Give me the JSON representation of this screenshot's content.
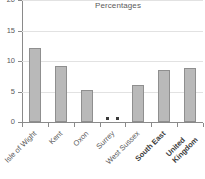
{
  "chart_data": {
    "type": "bar",
    "title": "Percentages",
    "xlabel": "",
    "ylabel": "",
    "categories": [
      "Isle of Wight",
      "Kent",
      "Oxon",
      "Surrey",
      "West Sussex",
      "South East",
      "United Kingdom"
    ],
    "category_lines": [
      [
        "Isle of Wight"
      ],
      [
        "Kent"
      ],
      [
        "Oxon"
      ],
      [
        "Surrey"
      ],
      [
        "West Sussex"
      ],
      [
        "South East"
      ],
      [
        "United",
        "Kingdom"
      ]
    ],
    "category_emphasis": [
      false,
      false,
      false,
      false,
      false,
      true,
      true
    ],
    "values": [
      12.2,
      9.1,
      5.2,
      null,
      6.0,
      8.5,
      8.9
    ],
    "value_notes": [
      "",
      "",
      "",
      "..",
      "",
      "",
      ""
    ],
    "ylim": [
      0,
      20
    ],
    "yticks": [
      0,
      5,
      10,
      15,
      20
    ],
    "ytick_labels": [
      "0",
      "5",
      "10",
      "15",
      "20"
    ],
    "grid": true,
    "grid_axis": "y",
    "legend": "none",
    "bar_color": "#b9b9b9",
    "bar_border_color": "#8f8f8f",
    "axis_color": "#8a8a8a",
    "grid_color": "#e2e2e2",
    "text_color": "#5a5a5a",
    "background": "#ffffff"
  }
}
